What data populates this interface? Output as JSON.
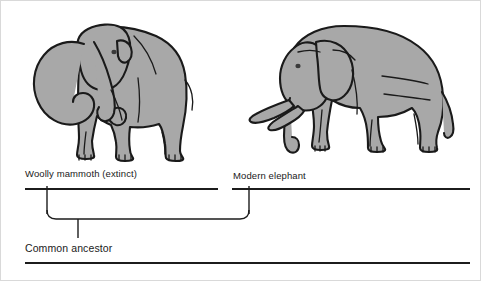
{
  "diagram": {
    "type": "cladogram",
    "title_visible": false,
    "background_color": "#ffffff",
    "line_color": "#1c1c1c",
    "illustration_fill": "#a8a8a8",
    "illustration_stroke": "#1a1a1a",
    "taxa": [
      {
        "id": "woolly-mammoth",
        "label": "Woolly mammoth (extinct)",
        "illustration": "mammoth-illustration",
        "branch_x": 47
      },
      {
        "id": "modern-elephant",
        "label": "Modern elephant",
        "illustration": "elephant-illustration",
        "branch_x": 249
      }
    ],
    "ancestor": {
      "id": "common-ancestor",
      "label": "Common ancestor",
      "stem_x": 78
    }
  }
}
